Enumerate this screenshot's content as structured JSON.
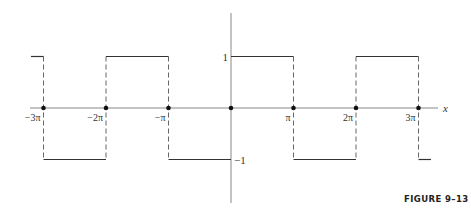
{
  "chart_data": {
    "type": "line",
    "title": "",
    "caption": "FIGURE 9–13",
    "xlabel": "x",
    "ylabel": "",
    "x_ticks": [
      {
        "label": "−3π",
        "value": -3
      },
      {
        "label": "−2π",
        "value": -2
      },
      {
        "label": "−π",
        "value": -1
      },
      {
        "label": "π",
        "value": 1
      },
      {
        "label": "2π",
        "value": 2
      },
      {
        "label": "3π",
        "value": 3
      }
    ],
    "y_ticks": [
      {
        "label": "1",
        "value": 1
      },
      {
        "label": "−1",
        "value": -1
      }
    ],
    "segments": [
      {
        "x0": -3.2,
        "x1": -3,
        "y": 1
      },
      {
        "x0": -3,
        "x1": -2,
        "y": -1
      },
      {
        "x0": -2,
        "x1": -1,
        "y": 1
      },
      {
        "x0": -1,
        "x1": 0,
        "y": -1
      },
      {
        "x0": 0,
        "x1": 1,
        "y": 1
      },
      {
        "x0": 1,
        "x1": 2,
        "y": -1
      },
      {
        "x0": 2,
        "x1": 3,
        "y": 1
      },
      {
        "x0": 3,
        "x1": 3.2,
        "y": -1
      }
    ],
    "points_on_axis": [
      -3,
      -2,
      -1,
      0,
      1,
      2,
      3
    ],
    "xlim": [
      -3.4,
      3.45
    ],
    "ylim": [
      -1.9,
      1.85
    ],
    "grid": false,
    "legend": null,
    "x_unit": "π"
  }
}
